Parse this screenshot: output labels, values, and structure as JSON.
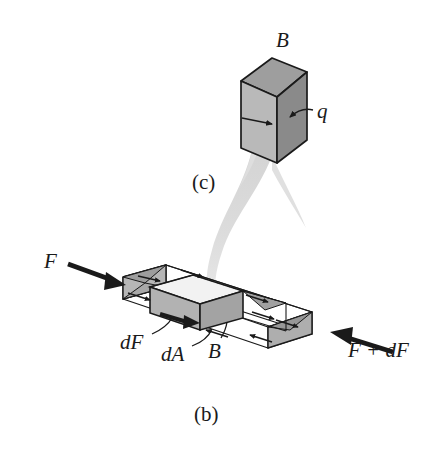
{
  "figure": {
    "background_color": "#ffffff",
    "width": 434,
    "height": 458
  },
  "panels": [
    {
      "id": "panel-c",
      "caption": "(c)",
      "description": "Magnified differential cube element B with heat/flux q entering the right face",
      "labels": {
        "block_label": "B",
        "flux_label": "q"
      },
      "colors": {
        "face_left": "#b4b4b4",
        "face_right": "#8a8a8a",
        "face_top": "#9e9e9e",
        "outline": "#1a1a1a"
      }
    },
    {
      "id": "panel-b",
      "caption": "(b)",
      "description": "Slab control volume with axial forces F at left and F + dF at right, differential element B of area dA carrying force dF",
      "labels": {
        "force_left": "F",
        "force_right": "F + dF",
        "differential_force": "dF",
        "differential_area": "dA",
        "element_label": "B"
      },
      "colors": {
        "shaded_face": "#b0b0b0",
        "shaded_end": "#9a9a9a",
        "wireframe": "#1a1a1a",
        "arrow": "#1a1a1a"
      }
    }
  ],
  "connector": {
    "name": "magnification-funnel",
    "description": "Tapered light-gray band linking element B in the slab to the magnified cube in panel (c)",
    "color": "#d8d8d8"
  }
}
